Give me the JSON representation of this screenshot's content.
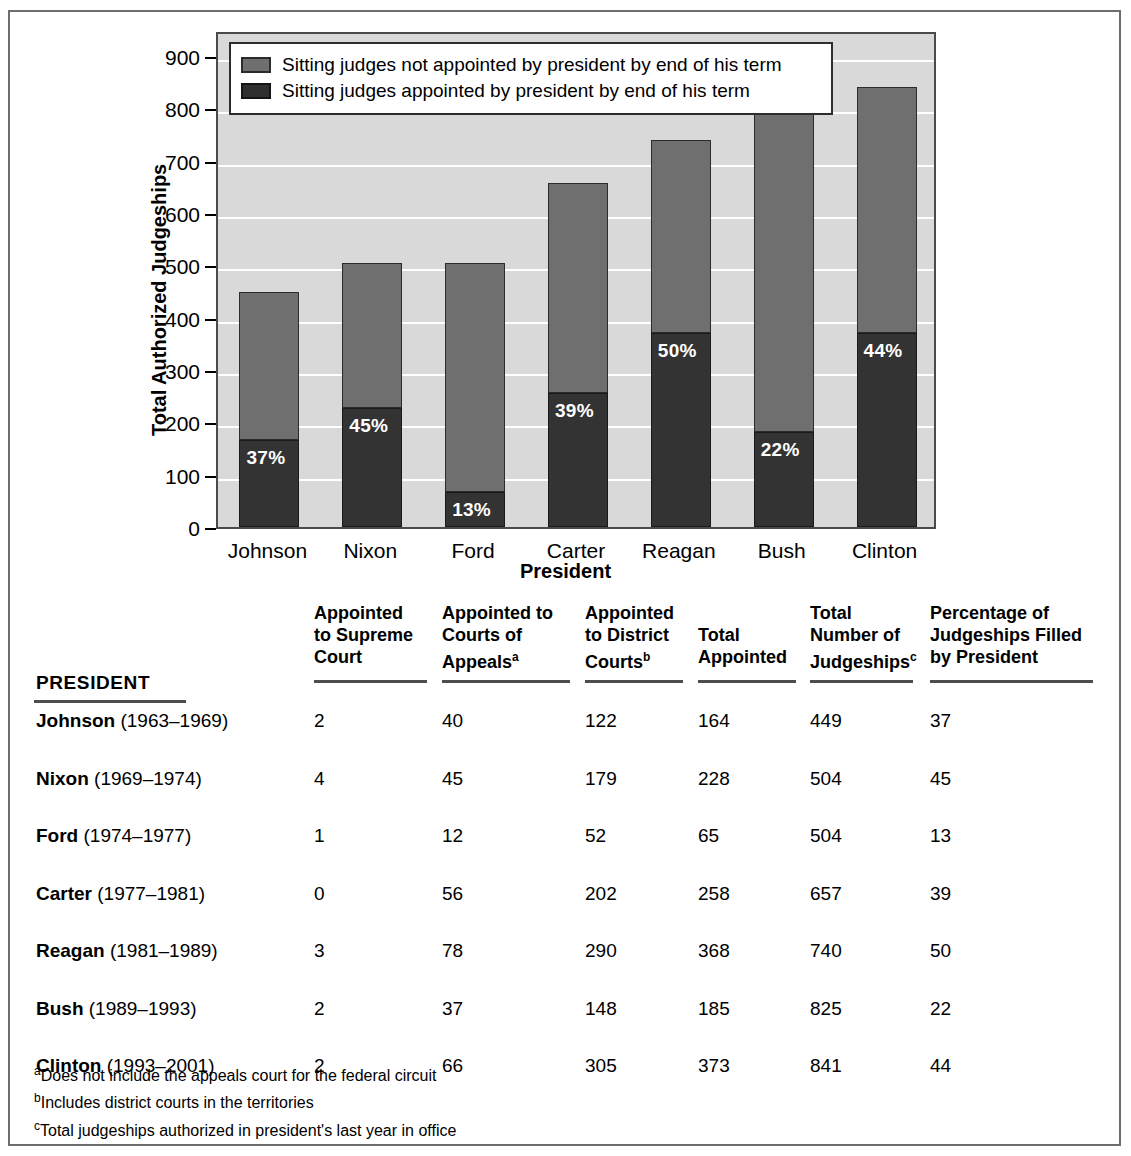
{
  "chart_data": {
    "type": "bar",
    "subtype": "stacked",
    "title": "",
    "xlabel": "President",
    "ylabel": "Total Authorized Judgeships",
    "ylim": [
      0,
      950
    ],
    "yticks": [
      0,
      100,
      200,
      300,
      400,
      500,
      600,
      700,
      800,
      900
    ],
    "grid": true,
    "legend_position": "top-inside",
    "categories": [
      "Johnson",
      "Nixon",
      "Ford",
      "Carter",
      "Reagan",
      "Bush",
      "Clinton"
    ],
    "series": [
      {
        "name": "Sitting judges appointed by president by end of his term",
        "color": "#333333",
        "values": [
          166,
          227,
          66,
          256,
          370,
          182,
          370
        ]
      },
      {
        "name": "Sitting judges not appointed by president by end of his term",
        "color": "#6f6f6f",
        "values": [
          283,
          277,
          438,
          401,
          370,
          643,
          471
        ]
      }
    ],
    "totals": [
      449,
      504,
      504,
      657,
      740,
      825,
      841
    ],
    "bar_labels": [
      "37%",
      "45%",
      "13%",
      "39%",
      "50%",
      "22%",
      "44%"
    ]
  },
  "chart": {
    "ylabel": "Total Authorized Judgeships",
    "xlabel": "President",
    "yticks": [
      "900",
      "800",
      "700",
      "600",
      "500",
      "400",
      "300",
      "200",
      "100",
      "0"
    ],
    "xticks": [
      "Johnson",
      "Nixon",
      "Ford",
      "Carter",
      "Reagan",
      "Bush",
      "Clinton"
    ],
    "legend": [
      "Sitting judges not appointed by president by end of his term",
      "Sitting judges appointed by president by end of his term"
    ],
    "bar_labels": [
      "37%",
      "45%",
      "13%",
      "39%",
      "50%",
      "22%",
      "44%"
    ]
  },
  "table": {
    "president_header": "PRESIDENT",
    "columns": [
      {
        "lines": [
          "Appointed",
          "to Supreme",
          "Court"
        ],
        "sup": ""
      },
      {
        "lines": [
          "Appointed to",
          "Courts of",
          "Appeals"
        ],
        "sup": "a"
      },
      {
        "lines": [
          "Appointed",
          "to District",
          "Courts"
        ],
        "sup": "b"
      },
      {
        "lines": [
          "Total",
          "Appointed"
        ],
        "sup": ""
      },
      {
        "lines": [
          "Total",
          "Number of",
          "Judgeships"
        ],
        "sup": "c"
      },
      {
        "lines": [
          "Percentage of",
          "Judgeships Filled",
          "by President"
        ],
        "sup": ""
      }
    ],
    "rows": [
      {
        "name": "Johnson",
        "years": "(1963–1969)",
        "values": [
          "2",
          "40",
          "122",
          "164",
          "449",
          "37"
        ]
      },
      {
        "name": "Nixon",
        "years": "(1969–1974)",
        "values": [
          "4",
          "45",
          "179",
          "228",
          "504",
          "45"
        ]
      },
      {
        "name": "Ford",
        "years": "(1974–1977)",
        "values": [
          "1",
          "12",
          "52",
          "65",
          "504",
          "13"
        ]
      },
      {
        "name": "Carter",
        "years": "(1977–1981)",
        "values": [
          "0",
          "56",
          "202",
          "258",
          "657",
          "39"
        ]
      },
      {
        "name": "Reagan",
        "years": "(1981–1989)",
        "values": [
          "3",
          "78",
          "290",
          "368",
          "740",
          "50"
        ]
      },
      {
        "name": "Bush",
        "years": "(1989–1993)",
        "values": [
          "2",
          "37",
          "148",
          "185",
          "825",
          "22"
        ]
      },
      {
        "name": "Clinton",
        "years": "(1993–2001)",
        "values": [
          "2",
          "66",
          "305",
          "373",
          "841",
          "44"
        ]
      }
    ],
    "footnotes": [
      {
        "sup": "a",
        "text": "Does not include the appeals court for the federal circuit"
      },
      {
        "sup": "b",
        "text": "Includes district courts in the territories"
      },
      {
        "sup": "c",
        "text": "Total judgeships authorized in president's last year in office"
      }
    ]
  }
}
